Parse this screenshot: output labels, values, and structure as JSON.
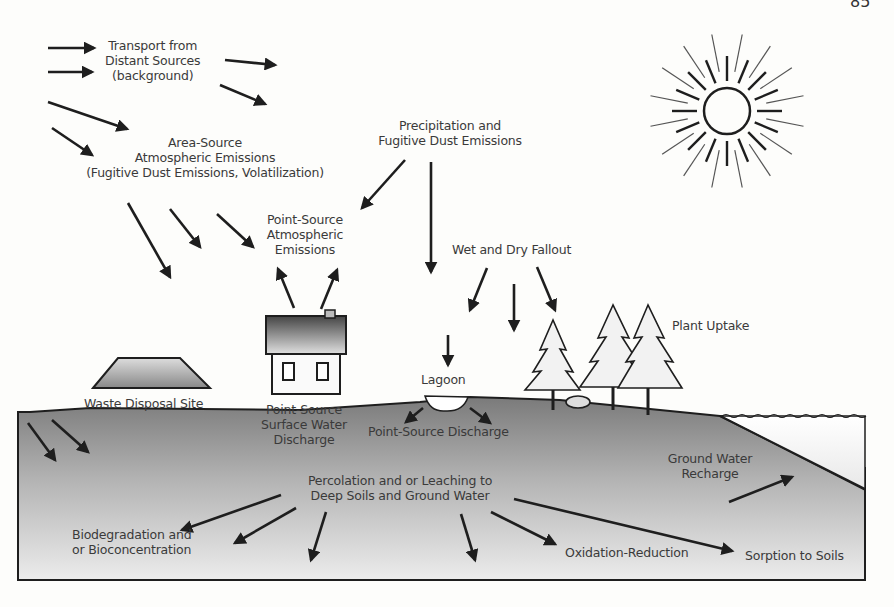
{
  "page": {
    "number": "85"
  },
  "diagram": {
    "title_hint": "Contaminant transport and fate pathways",
    "labels": {
      "transport": [
        "Transport from",
        "Distant Sources",
        "(background)"
      ],
      "area_source": [
        "Area-Source",
        "Atmospheric Emissions",
        "(Fugitive Dust Emissions,  Volatilization)"
      ],
      "precipitation": [
        "Precipitation and",
        "Fugitive Dust Emissions"
      ],
      "point_atmos": [
        "Point-Source",
        "Atmospheric",
        "Emissions"
      ],
      "wet_dry": [
        "Wet and Dry Fallout"
      ],
      "plant_uptake": [
        "Plant Uptake"
      ],
      "lagoon": [
        "Lagoon"
      ],
      "waste_site": [
        "Waste Disposal Site"
      ],
      "point_surface": [
        "Point-Source",
        "Surface Water",
        "Discharge"
      ],
      "point_discharge": [
        "Point-Source Discharge"
      ],
      "gw_recharge": [
        "Ground Water",
        "Recharge"
      ],
      "percolation": [
        "Percolation and or Leaching to",
        "Deep Soils and Ground Water"
      ],
      "biodeg": [
        "Biodegradation and",
        "or Bioconcentration"
      ],
      "oxidation": [
        "Oxidation-Reduction"
      ],
      "sorption": [
        "Sorption to Soils"
      ]
    },
    "elements": [
      "sun",
      "house",
      "waste-disposal-mound",
      "lagoon",
      "pine-trees",
      "ground-water-body",
      "soil-cross-section"
    ],
    "colors": {
      "ink": "#1e1e1e",
      "soil_dark": "#7d7d7d",
      "soil_light": "#e6e6e6",
      "background": "#fdfdfb"
    }
  }
}
